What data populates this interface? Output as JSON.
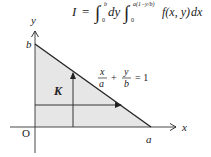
{
  "formula": {
    "lhs": "I",
    "eq": "=",
    "outer_integral": {
      "lower": "0",
      "upper": "b",
      "differential": "dy"
    },
    "inner_integral": {
      "lower": "0",
      "upper": "a(1−y/b)"
    },
    "integrand": "f(x, y)",
    "inner_differential": "dx"
  },
  "diagram": {
    "axis_x_label": "x",
    "axis_y_label": "y",
    "origin_label": "O",
    "x_intercept_label": "a",
    "y_intercept_label": "b",
    "region_label": "K",
    "line_equation": {
      "x_num": "x",
      "x_den": "a",
      "plus": "+",
      "y_num": "y",
      "y_den": "b",
      "rhs": "= 1"
    },
    "colors": {
      "region_fill": "#e6e6e6",
      "line": "#222222"
    }
  }
}
